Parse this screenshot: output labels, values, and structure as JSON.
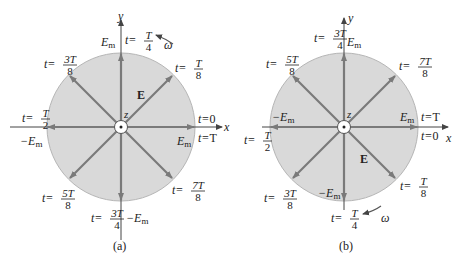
{
  "colors": {
    "disk_fill": "#d9d9d9",
    "disk_stroke": "#b5b5b5",
    "vector": "#7a7a7a",
    "axis": "#444444",
    "text": "#222222"
  },
  "panels": [
    {
      "id": "a",
      "caption": "(a)",
      "axis_x": "x",
      "axis_y": "y",
      "axis_z": "z",
      "field_label": "E",
      "omega_label": "ω",
      "rotation": "counterclockwise",
      "amp_pos_x": "E",
      "amp_neg_x": "−E",
      "amp_pos_y": "E",
      "amp_neg_y": "−E",
      "amp_sub": "m",
      "times": {
        "t0": {
          "pre": "t=",
          "num": "",
          "den": "",
          "plain": "0"
        },
        "tT": {
          "pre": "t=",
          "num": "",
          "den": "",
          "plain": "T"
        },
        "t1": {
          "pre": "t=",
          "num": "T",
          "den": "8"
        },
        "t2": {
          "pre": "t=",
          "num": "T",
          "den": "4"
        },
        "t3": {
          "pre": "t=",
          "num": "3T",
          "den": "8"
        },
        "t4": {
          "pre": "t=",
          "num": "T",
          "den": "2"
        },
        "t5": {
          "pre": "t=",
          "num": "5T",
          "den": "8"
        },
        "t6": {
          "pre": "t=",
          "num": "3T",
          "den": "4"
        },
        "t7": {
          "pre": "t=",
          "num": "7T",
          "den": "8"
        }
      }
    },
    {
      "id": "b",
      "caption": "(b)",
      "axis_x": "x",
      "axis_y": "y",
      "axis_z": "z",
      "field_label": "E",
      "omega_label": "ω",
      "rotation": "clockwise",
      "amp_pos_x": "E",
      "amp_neg_x": "−E",
      "amp_pos_y": "E",
      "amp_neg_y": "−E",
      "amp_sub": "m",
      "times": {
        "t0": {
          "pre": "t=",
          "plain": "0"
        },
        "tT": {
          "pre": "t=",
          "plain": "T"
        },
        "t1": {
          "pre": "t=",
          "num": "T",
          "den": "8"
        },
        "t2": {
          "pre": "t=",
          "num": "T",
          "den": "4"
        },
        "t3": {
          "pre": "t=",
          "num": "3T",
          "den": "8"
        },
        "t4": {
          "pre": "t=",
          "num": "T",
          "den": "2"
        },
        "t5": {
          "pre": "t=",
          "num": "5T",
          "den": "8"
        },
        "t6": {
          "pre": "t=",
          "num": "3T",
          "den": "4"
        },
        "t7": {
          "pre": "t=",
          "num": "7T",
          "den": "8"
        }
      }
    }
  ]
}
